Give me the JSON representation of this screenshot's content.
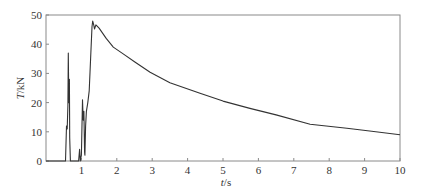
{
  "chart_data": {
    "type": "line",
    "title": "",
    "xlabel": "t/s",
    "xlabel_italic": "t",
    "xlabel_unit": "/s",
    "ylabel": "T/kN",
    "ylabel_italic": "T",
    "ylabel_unit": "/kN",
    "xlim": [
      0,
      10
    ],
    "ylim": [
      0,
      50
    ],
    "xticks": [
      1,
      2,
      3,
      4,
      5,
      6,
      7,
      8,
      9,
      10
    ],
    "yticks": [
      0,
      10,
      20,
      30,
      40,
      50
    ],
    "grid": false,
    "legend": null,
    "series": [
      {
        "name": "T",
        "color": "#333333",
        "x": [
          0.0,
          0.55,
          0.58,
          0.6,
          0.62,
          0.63,
          0.645,
          0.66,
          0.67,
          0.69,
          0.7,
          0.92,
          0.95,
          0.97,
          1.0,
          1.03,
          1.05,
          1.07,
          1.09,
          1.1,
          1.12,
          1.14,
          1.18,
          1.22,
          1.26,
          1.3,
          1.32,
          1.35,
          1.37,
          1.41,
          1.5,
          1.7,
          1.9,
          2.2,
          2.5,
          2.94,
          3.5,
          4.35,
          5.0,
          5.76,
          6.5,
          7.46,
          8.5,
          9.2,
          10.0
        ],
        "y": [
          0,
          0,
          12,
          11,
          19,
          37,
          20,
          28,
          8,
          0,
          0,
          0,
          4,
          0,
          2,
          21,
          14,
          17,
          3,
          2,
          12,
          17,
          20,
          24,
          35,
          46,
          47.9,
          46.5,
          45.2,
          46.6,
          45.5,
          42,
          39,
          36.5,
          34,
          30.4,
          26.8,
          23.2,
          20.5,
          18.0,
          15.8,
          12.6,
          11.2,
          10.2,
          9.0
        ]
      }
    ]
  }
}
